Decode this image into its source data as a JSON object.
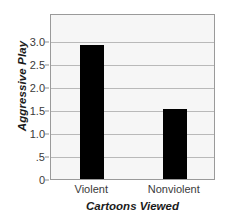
{
  "chart_data": {
    "type": "bar",
    "title": "",
    "xlabel": "Cartoons Viewed",
    "ylabel": "Aggressive Play",
    "categories": [
      "Violent",
      "Nonviolent"
    ],
    "values": [
      2.9,
      1.52
    ],
    "ylim": [
      0,
      3.6
    ],
    "yticks": [
      0,
      0.5,
      1.0,
      1.5,
      2.0,
      2.5,
      3.0
    ],
    "ytick_labels": [
      "0",
      ".5",
      "1.0",
      "1.5",
      "2.0",
      "2.5",
      "3.0"
    ],
    "grid": true,
    "legend": "none",
    "bar_color": "#000000",
    "plot_background": "#f6f6f6",
    "gridline_color": "#b9b9b9",
    "axis_border_color": "#9a9a9a"
  },
  "credit": {
    "text": "© Cengage Learning"
  }
}
